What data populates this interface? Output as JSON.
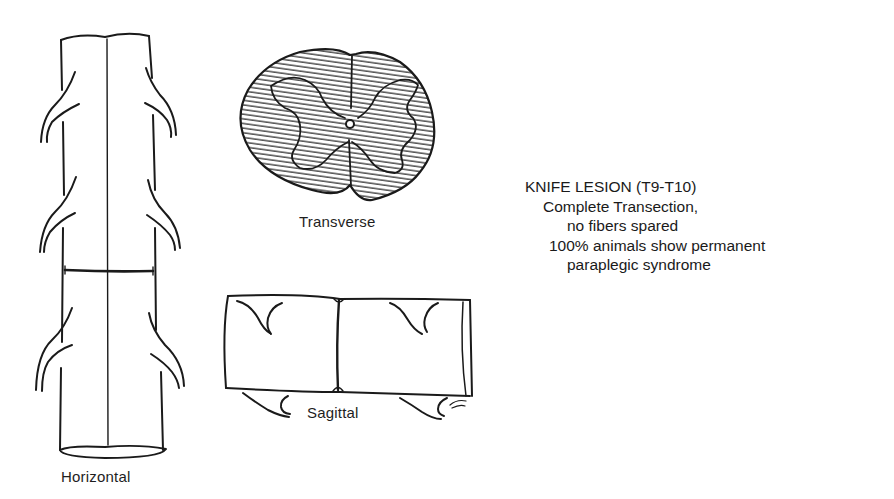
{
  "figure": {
    "panels": [
      {
        "id": "horizontal",
        "label": "Horizontal"
      },
      {
        "id": "transverse",
        "label": "Transverse"
      },
      {
        "id": "sagittal",
        "label": "Sagittal"
      }
    ],
    "annotation": {
      "title": "KNIFE LESION (T9-T10)",
      "lines": [
        "Complete Transection,",
        "no fibers spared",
        "100% animals show permanent",
        "paraplegic syndrome"
      ]
    },
    "colors": {
      "ink": "#1a1a1a",
      "background": "#ffffff"
    }
  }
}
